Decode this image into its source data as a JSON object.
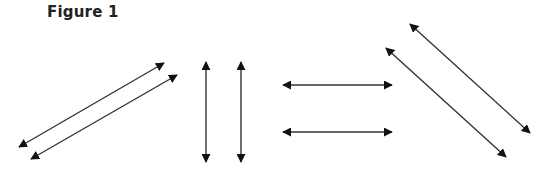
{
  "figure": {
    "title": "Figure 1",
    "stroke_color": "#333333",
    "head_color": "#111111"
  },
  "arrows": [
    {
      "group": "diagonal-rising",
      "x1": 19,
      "y1": 147,
      "x2": 164,
      "y2": 63
    },
    {
      "group": "diagonal-rising",
      "x1": 31,
      "y1": 159,
      "x2": 177,
      "y2": 75
    },
    {
      "group": "vertical",
      "x1": 206,
      "y1": 62,
      "x2": 206,
      "y2": 162
    },
    {
      "group": "vertical",
      "x1": 241,
      "y1": 62,
      "x2": 241,
      "y2": 162
    },
    {
      "group": "horizontal",
      "x1": 283,
      "y1": 85,
      "x2": 392,
      "y2": 85
    },
    {
      "group": "horizontal",
      "x1": 283,
      "y1": 132,
      "x2": 392,
      "y2": 132
    },
    {
      "group": "diagonal-falling",
      "x1": 410,
      "y1": 24,
      "x2": 530,
      "y2": 133
    },
    {
      "group": "diagonal-falling",
      "x1": 386,
      "y1": 48,
      "x2": 506,
      "y2": 157
    }
  ]
}
